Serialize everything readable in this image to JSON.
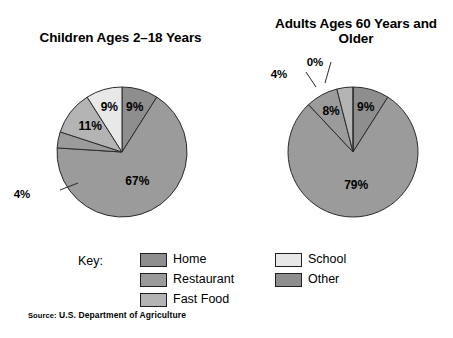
{
  "page": {
    "background": "#ffffff",
    "source_note_prefix": "Source:",
    "source_note": "U.S. Department of Agriculture"
  },
  "legend": {
    "key_label": "Key:",
    "columns": [
      {
        "items": [
          {
            "label": "Home",
            "color": "#8e8e8e"
          },
          {
            "label": "Restaurant",
            "color": "#9b9b9b"
          },
          {
            "label": "Fast Food",
            "color": "#b4b4b4"
          }
        ]
      },
      {
        "items": [
          {
            "label": "School",
            "color": "#e8e8e8"
          },
          {
            "label": "Other",
            "color": "#8e8e8e"
          }
        ]
      }
    ]
  },
  "charts": [
    {
      "id": "children",
      "title": "Children Ages 2–18 Years",
      "center": {
        "x": 122,
        "y": 152
      },
      "radius": 65
    },
    {
      "id": "adults",
      "title": "Adults Ages 60 Years and Older",
      "center": {
        "x": 353,
        "y": 152
      },
      "radius": 65
    }
  ],
  "chart_data": [
    {
      "type": "pie",
      "title": "Children Ages 2–18 Years",
      "categories": [
        "Home",
        "Restaurant",
        "Fast Food",
        "School",
        "Other"
      ],
      "values": [
        67,
        4,
        11,
        9,
        9
      ],
      "labels": [
        "67%",
        "4%",
        "11%",
        "9%",
        "9%"
      ],
      "colors": [
        "#9b9b9b",
        "#9b9b9b",
        "#b4b4b4",
        "#e8e8e8",
        "#8e8e8e"
      ],
      "unit": "percent",
      "legend_position": "bottom",
      "grid": false
    },
    {
      "type": "pie",
      "title": "Adults Ages 60 Years and Older",
      "categories": [
        "Home",
        "Restaurant",
        "Fast Food",
        "School",
        "Other"
      ],
      "values": [
        79,
        8,
        4,
        0,
        9
      ],
      "labels": [
        "79%",
        "8%",
        "4%",
        "0%",
        "9%"
      ],
      "colors": [
        "#9b9b9b",
        "#9b9b9b",
        "#b4b4b4",
        "#e8e8e8",
        "#8e8e8e"
      ],
      "unit": "percent",
      "legend_position": "bottom",
      "grid": false
    }
  ]
}
